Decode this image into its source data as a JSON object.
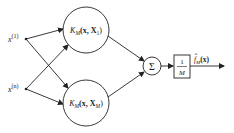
{
  "diagram": {
    "type": "kernel-sum network",
    "inputs": [
      {
        "id": "x1",
        "base": "x",
        "sup": "(1)"
      },
      {
        "id": "xn",
        "base": "x",
        "sup": "(n)"
      }
    ],
    "kernels": [
      {
        "id": "k1",
        "K": "K",
        "sub": "M",
        "args": "(x, X",
        "arg_sub": "1",
        "close": ")"
      },
      {
        "id": "kM",
        "K": "K",
        "sub": "M",
        "args": "(x, X",
        "arg_sub": "M",
        "close": ")"
      }
    ],
    "sum_symbol": "Σ",
    "scale": {
      "num": "1",
      "den": "M"
    },
    "output": {
      "base": "f̂",
      "sub": "M",
      "arg": "(x)"
    },
    "edges": [
      [
        "x1",
        "k1"
      ],
      [
        "x1",
        "kM"
      ],
      [
        "xn",
        "k1"
      ],
      [
        "xn",
        "kM"
      ],
      [
        "k1",
        "sum"
      ],
      [
        "kM",
        "sum"
      ],
      [
        "sum",
        "scale"
      ],
      [
        "scale",
        "output"
      ]
    ],
    "colors": {
      "stroke": "#222222",
      "background": "#ffffff"
    }
  }
}
